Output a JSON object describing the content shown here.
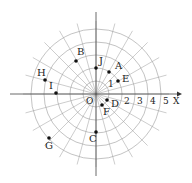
{
  "diagram": {
    "origin_label": "O",
    "axis_label": "X",
    "radial_tick_labels": [
      "1",
      "2",
      "3",
      "4",
      "5"
    ],
    "rings": 5,
    "spokes": 24,
    "colors": {
      "grid": "#9a9a9a",
      "axis": "#444444",
      "point": "#111111",
      "text": "#222222"
    },
    "points": [
      {
        "name": "A",
        "x": 109,
        "y": 72,
        "lx": 115,
        "ly": 69
      },
      {
        "name": "B",
        "x": 76,
        "y": 61,
        "lx": 77,
        "ly": 55
      },
      {
        "name": "C",
        "x": 96,
        "y": 132,
        "lx": 89,
        "ly": 142
      },
      {
        "name": "D",
        "x": 107,
        "y": 100,
        "lx": 111,
        "ly": 107
      },
      {
        "name": "E",
        "x": 118,
        "y": 81,
        "lx": 122,
        "ly": 82
      },
      {
        "name": "F",
        "x": 102,
        "y": 105,
        "lx": 103,
        "ly": 115
      },
      {
        "name": "G",
        "x": 49,
        "y": 138,
        "lx": 45,
        "ly": 149
      },
      {
        "name": "H",
        "x": 45,
        "y": 80,
        "lx": 37,
        "ly": 76
      },
      {
        "name": "I",
        "x": 56,
        "y": 93,
        "lx": 49,
        "ly": 89
      },
      {
        "name": "J",
        "x": 96,
        "y": 68,
        "lx": 99,
        "ly": 64
      }
    ]
  }
}
